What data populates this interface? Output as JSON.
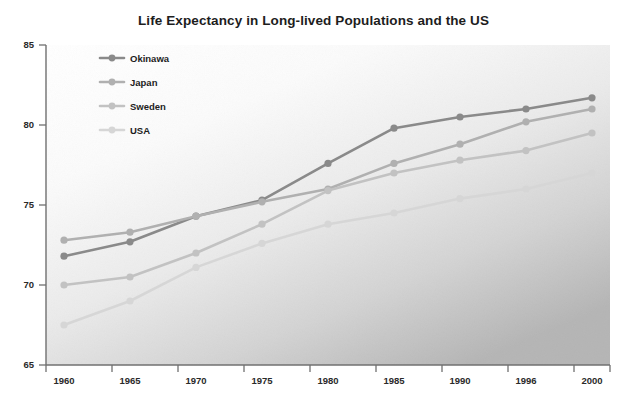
{
  "chart_data": {
    "type": "line",
    "title": "Life Expectancy in Long-lived Populations and the US",
    "xlabel": "",
    "ylabel": "",
    "categories": [
      "1960",
      "1965",
      "1970",
      "1975",
      "1980",
      "1985",
      "1990",
      "1996",
      "2000"
    ],
    "x": [
      1960,
      1965,
      1970,
      1975,
      1980,
      1985,
      1990,
      1996,
      2000
    ],
    "xtick_labels": [
      "1960",
      "1965",
      "1970",
      "1975",
      "1980",
      "1985",
      "1990",
      "1996",
      "2000"
    ],
    "ytick_labels": [
      "65",
      "70",
      "75",
      "80",
      "85"
    ],
    "yticks": [
      65,
      70,
      75,
      80,
      85
    ],
    "ylim": [
      65,
      85
    ],
    "grid": false,
    "legend_position": "upper-left-inside",
    "series": [
      {
        "name": "Okinawa",
        "color": "#8a8a8a",
        "marker": "circle",
        "values": [
          71.8,
          72.7,
          74.3,
          75.3,
          77.6,
          79.8,
          80.5,
          81.0,
          81.7
        ]
      },
      {
        "name": "Japan",
        "color": "#b0b0b0",
        "marker": "circle",
        "values": [
          72.8,
          73.3,
          74.3,
          75.2,
          76.0,
          77.6,
          78.8,
          80.2,
          81.0
        ]
      },
      {
        "name": "Sweden",
        "color": "#c2c2c2",
        "marker": "circle",
        "values": [
          70.0,
          70.5,
          72.0,
          73.8,
          75.9,
          77.0,
          77.8,
          78.4,
          79.5
        ]
      },
      {
        "name": "USA",
        "color": "#d6d6d6",
        "marker": "circle",
        "values": [
          67.5,
          69.0,
          71.1,
          72.6,
          73.8,
          74.5,
          75.4,
          76.0,
          77.0
        ]
      }
    ]
  },
  "legend": {
    "entries": [
      {
        "label": "Okinawa"
      },
      {
        "label": "Japan"
      },
      {
        "label": "Sweden"
      },
      {
        "label": "USA"
      }
    ]
  },
  "colors": {
    "title": "#1d1d1d",
    "axis": "#6f6f6f",
    "background_top": "#ffffff",
    "background_bottom": "#b9b9b9"
  }
}
